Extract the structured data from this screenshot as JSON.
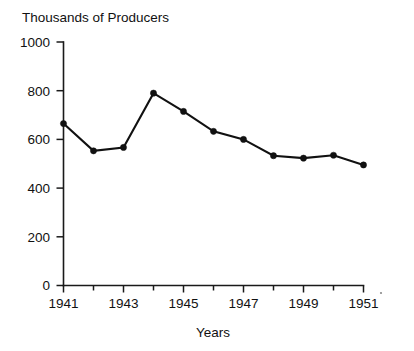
{
  "chart_data": {
    "type": "line",
    "title": "Thousands of Producers",
    "xlabel": "Years",
    "ylabel": "",
    "x": [
      1941,
      1942,
      1943,
      1944,
      1945,
      1946,
      1947,
      1948,
      1949,
      1950,
      1951
    ],
    "values": [
      665,
      553,
      567,
      790,
      715,
      633,
      600,
      533,
      523,
      535,
      495
    ],
    "series": [
      {
        "name": "Producers",
        "values": [
          665,
          553,
          567,
          790,
          715,
          633,
          600,
          533,
          523,
          535,
          495
        ]
      }
    ],
    "xlim": [
      1941,
      1951
    ],
    "ylim": [
      0,
      1000
    ],
    "ytick_labels": [
      "0",
      "200",
      "400",
      "600",
      "800",
      "1000"
    ],
    "ytick_values": [
      0,
      200,
      400,
      600,
      800,
      1000
    ],
    "xtick_labels": [
      "1941",
      "1943",
      "1945",
      "1947",
      "1949",
      "1951"
    ],
    "xtick_values": [
      1941,
      1943,
      1945,
      1947,
      1949,
      1951
    ],
    "minor_xticks": [
      1942,
      1944,
      1946,
      1948,
      1950
    ],
    "grid": false,
    "legend": false,
    "legend_position": "none",
    "marker": "filled-circle",
    "line_color": "#111111",
    "marker_color": "#111111",
    "background_color": "#ffffff"
  }
}
